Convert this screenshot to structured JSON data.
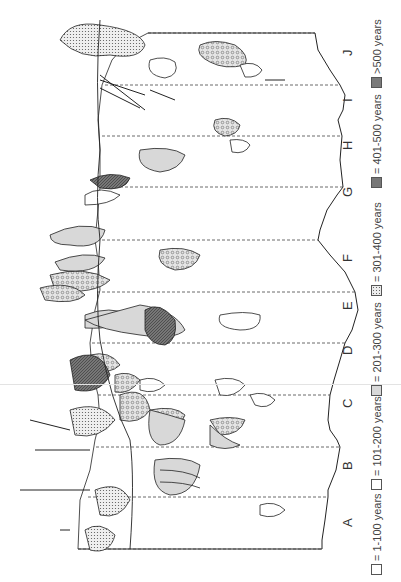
{
  "figure": {
    "type": "rotated-zoned-map",
    "orientation": "rotated 90 degrees counter-clockwise",
    "zones": [
      "A",
      "B",
      "C",
      "D",
      "E",
      "F",
      "G",
      "H",
      "I",
      "J"
    ],
    "legend": [
      {
        "label": "= 1-100 years",
        "pattern": "open"
      },
      {
        "label": "= 101-200 years",
        "pattern": "open-outline"
      },
      {
        "label": "= 201-300 years",
        "pattern": "light-gray"
      },
      {
        "label": "= 301-400 years",
        "pattern": "coarse-stipple"
      },
      {
        "label": "= 401-500 years",
        "pattern": "fine-stipple"
      },
      {
        "label": ">500 years",
        "pattern": "dark-hatch"
      }
    ],
    "colors": {
      "line": "#222222",
      "dashed": "#444444",
      "light_gray": "#d8d8d8",
      "stipple_bg": "#ececec",
      "dark": "#6e6e6e",
      "background": "#ffffff"
    }
  }
}
